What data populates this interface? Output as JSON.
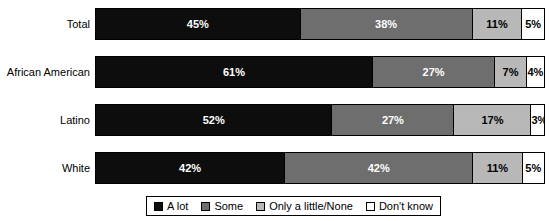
{
  "chart_data": {
    "type": "bar",
    "orientation": "horizontal",
    "stacked": true,
    "stack_mode": "percent",
    "title": "",
    "subtitle": "",
    "xlabel": "",
    "ylabel": "",
    "xlim": [
      0,
      100
    ],
    "grid": false,
    "legend_position": "bottom",
    "categories": [
      "Total",
      "African American",
      "Latino",
      "White"
    ],
    "series": [
      {
        "name": "A lot",
        "color": "#0d0d0d",
        "values": [
          45,
          61,
          52,
          42
        ]
      },
      {
        "name": "Some",
        "color": "#6e6e6e",
        "values": [
          38,
          27,
          27,
          42
        ]
      },
      {
        "name": "Only a little/None",
        "color": "#b8b8b8",
        "values": [
          11,
          7,
          17,
          11
        ]
      },
      {
        "name": "Don't know",
        "color": "#ffffff",
        "values": [
          5,
          4,
          3,
          5
        ]
      }
    ],
    "rows": [
      {
        "label": "Total",
        "segments": [
          {
            "series": "A lot",
            "value": 45,
            "label": "45%"
          },
          {
            "series": "Some",
            "value": 38,
            "label": "38%"
          },
          {
            "series": "Only a little/None",
            "value": 11,
            "label": "11%"
          },
          {
            "series": "Don't know",
            "value": 5,
            "label": "5%"
          }
        ]
      },
      {
        "label": "African American",
        "segments": [
          {
            "series": "A lot",
            "value": 61,
            "label": "61%"
          },
          {
            "series": "Some",
            "value": 27,
            "label": "27%"
          },
          {
            "series": "Only a little/None",
            "value": 7,
            "label": "7%"
          },
          {
            "series": "Don't know",
            "value": 4,
            "label": "4%"
          }
        ]
      },
      {
        "label": "Latino",
        "segments": [
          {
            "series": "A lot",
            "value": 52,
            "label": "52%"
          },
          {
            "series": "Some",
            "value": 27,
            "label": "27%"
          },
          {
            "series": "Only a little/None",
            "value": 17,
            "label": "17%"
          },
          {
            "series": "Don't know",
            "value": 3,
            "label": "3%"
          }
        ]
      },
      {
        "label": "White",
        "segments": [
          {
            "series": "A lot",
            "value": 42,
            "label": "42%"
          },
          {
            "series": "Some",
            "value": 42,
            "label": "42%"
          },
          {
            "series": "Only a little/None",
            "value": 11,
            "label": "11%"
          },
          {
            "series": "Don't know",
            "value": 5,
            "label": "5%"
          }
        ]
      }
    ],
    "legend": [
      {
        "label": "A lot",
        "color": "#0d0d0d"
      },
      {
        "label": "Some",
        "color": "#6e6e6e"
      },
      {
        "label": "Only a little/None",
        "color": "#b8b8b8"
      },
      {
        "label": "Don't know",
        "color": "#ffffff"
      }
    ]
  }
}
